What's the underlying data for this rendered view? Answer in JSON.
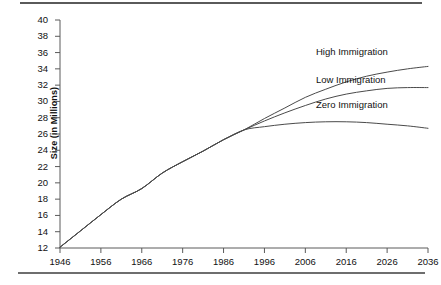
{
  "figure": {
    "name": "population-projection-chart",
    "has_top_rule": true,
    "has_bottom_rule": true,
    "background_color": "#ffffff",
    "line_color": "#4a4a4a"
  },
  "chart_data": {
    "type": "line",
    "title": "",
    "xlabel": "",
    "ylabel": "Size (in Millions)",
    "xlim": [
      1946,
      2036
    ],
    "ylim": [
      12,
      40
    ],
    "xticks": [
      1946,
      1956,
      1966,
      1976,
      1986,
      1996,
      2006,
      2016,
      2026,
      2036
    ],
    "yticks": [
      12,
      14,
      16,
      18,
      20,
      22,
      24,
      26,
      28,
      30,
      32,
      34,
      36,
      38,
      40
    ],
    "grid": false,
    "legend_position": "inline-right",
    "series": [
      {
        "name": "High Immigration",
        "label": "High Immigration",
        "x": [
          1946,
          1951,
          1956,
          1961,
          1966,
          1971,
          1976,
          1981,
          1986,
          1991,
          1996,
          2001,
          2006,
          2011,
          2016,
          2021,
          2026,
          2031,
          2036
        ],
        "values": [
          12.1,
          14.1,
          16.1,
          18.0,
          19.3,
          21.2,
          22.6,
          23.9,
          25.3,
          26.5,
          27.9,
          29.2,
          30.5,
          31.5,
          32.4,
          33.1,
          33.6,
          34.0,
          34.3
        ]
      },
      {
        "name": "Low Immigration",
        "label": "Low Immigration",
        "x": [
          1946,
          1951,
          1956,
          1961,
          1966,
          1971,
          1976,
          1981,
          1986,
          1991,
          1996,
          2001,
          2006,
          2011,
          2016,
          2021,
          2026,
          2031,
          2036
        ],
        "values": [
          12.1,
          14.1,
          16.1,
          18.0,
          19.3,
          21.2,
          22.6,
          23.9,
          25.3,
          26.5,
          27.6,
          28.6,
          29.5,
          30.3,
          30.9,
          31.3,
          31.6,
          31.7,
          31.7
        ]
      },
      {
        "name": "Zero Immigration",
        "label": "Zero Immigration",
        "x": [
          1946,
          1951,
          1956,
          1961,
          1966,
          1971,
          1976,
          1981,
          1986,
          1991,
          1996,
          2001,
          2006,
          2011,
          2016,
          2021,
          2026,
          2031,
          2036
        ],
        "values": [
          12.1,
          14.1,
          16.1,
          18.0,
          19.3,
          21.2,
          22.6,
          23.9,
          25.3,
          26.5,
          26.9,
          27.2,
          27.4,
          27.5,
          27.5,
          27.4,
          27.2,
          27.0,
          26.7
        ]
      }
    ],
    "annotations": [
      {
        "text": "High Immigration",
        "x": 2013,
        "y": 35.9
      },
      {
        "text": "Low Immigration",
        "x": 2013,
        "y": 32.5
      },
      {
        "text": "Zero Immigration",
        "x": 2013,
        "y": 29.5
      }
    ]
  }
}
